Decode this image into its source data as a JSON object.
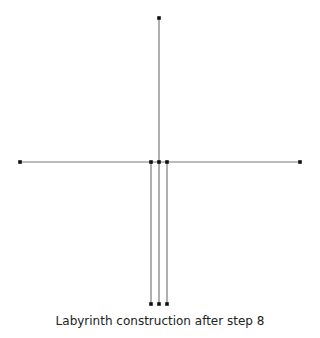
{
  "caption": "Labyrinth construction after step 8",
  "colors": {
    "line": "#7a7a7a",
    "node": "#111111",
    "background": "#ffffff"
  },
  "diagram": {
    "nodes": [
      {
        "id": "top",
        "x": 159,
        "y": 18
      },
      {
        "id": "left",
        "x": 20,
        "y": 162
      },
      {
        "id": "right",
        "x": 300,
        "y": 162
      },
      {
        "id": "center-left",
        "x": 151,
        "y": 162
      },
      {
        "id": "center",
        "x": 159,
        "y": 162
      },
      {
        "id": "center-right",
        "x": 167,
        "y": 162
      },
      {
        "id": "bottom-left",
        "x": 151,
        "y": 304
      },
      {
        "id": "bottom-center",
        "x": 159,
        "y": 304
      },
      {
        "id": "bottom-right",
        "x": 167,
        "y": 304
      }
    ],
    "edges": [
      {
        "from": "left",
        "to": "right"
      },
      {
        "from": "top",
        "to": "bottom-center"
      },
      {
        "from": "center-left",
        "to": "bottom-left"
      },
      {
        "from": "center-right",
        "to": "bottom-right"
      }
    ]
  }
}
